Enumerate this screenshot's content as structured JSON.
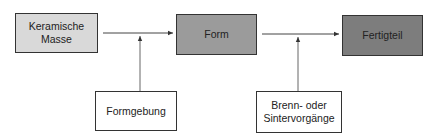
{
  "diagram": {
    "nodes": [
      {
        "id": "keramische-masse",
        "label": "Keramische\nMasse",
        "fill": "#d9d9d9"
      },
      {
        "id": "form",
        "label": "Form",
        "fill": "#9b9b9b"
      },
      {
        "id": "fertigteil",
        "label": "Fertigteil",
        "fill": "#7d7d7d"
      },
      {
        "id": "formgebung",
        "label": "Formgebung",
        "fill": "#ffffff"
      },
      {
        "id": "brenn",
        "label": "Brenn- oder\nSintervorgänge",
        "fill": "#ffffff"
      }
    ],
    "edges": [
      {
        "from": "keramische-masse",
        "to": "form"
      },
      {
        "from": "formgebung",
        "to": "edge-1"
      },
      {
        "from": "form",
        "to": "fertigteil"
      },
      {
        "from": "brenn",
        "to": "edge-2"
      }
    ]
  }
}
